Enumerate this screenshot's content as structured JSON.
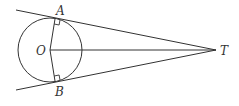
{
  "diagram": {
    "points": {
      "A": {
        "label": "A",
        "x": 55,
        "y": 19
      },
      "B": {
        "label": "B",
        "x": 55,
        "y": 81
      },
      "O": {
        "label": "O",
        "x": 50,
        "y": 50
      },
      "T": {
        "label": "T",
        "x": 216,
        "y": 50
      }
    },
    "circle": {
      "cx": 50,
      "cy": 50,
      "r": 32
    },
    "right_angle_marks": [
      "A",
      "B"
    ],
    "stroke_color": "#333333"
  }
}
